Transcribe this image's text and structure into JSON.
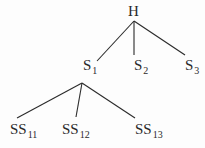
{
  "diagram": {
    "type": "tree",
    "root": {
      "label": "H",
      "children": [
        {
          "label": "S",
          "subscript": "1",
          "children": [
            {
              "label": "SS",
              "subscript": "11"
            },
            {
              "label": "SS",
              "subscript": "12"
            },
            {
              "label": "SS",
              "subscript": "13"
            }
          ]
        },
        {
          "label": "S",
          "subscript": "2"
        },
        {
          "label": "S",
          "subscript": "3"
        }
      ]
    },
    "nodes": {
      "h": {
        "label": "H"
      },
      "s1": {
        "label": "S",
        "sub": "1"
      },
      "s2": {
        "label": "S",
        "sub": "2"
      },
      "s3": {
        "label": "S",
        "sub": "3"
      },
      "ss11": {
        "label": "SS",
        "sub": "11"
      },
      "ss12": {
        "label": "SS",
        "sub": "12"
      },
      "ss13": {
        "label": "SS",
        "sub": "13"
      }
    },
    "line_color": "#2a2a2a"
  }
}
